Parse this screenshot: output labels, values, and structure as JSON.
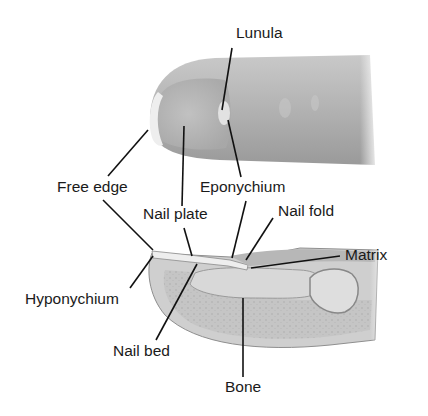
{
  "diagram": {
    "views": [
      "finger-exterior",
      "finger-cross-section"
    ],
    "labels": {
      "lunula": "Lunula",
      "free_edge": "Free edge",
      "eponychium": "Eponychium",
      "nail_plate": "Nail plate",
      "nail_fold": "Nail fold",
      "matrix": "Matrix",
      "hyponychium": "Hyponychium",
      "nail_bed": "Nail bed",
      "bone": "Bone"
    },
    "colors": {
      "background": "#ffffff",
      "skin": "#b5b5b5",
      "skin_dark": "#8e8e8e",
      "nail_highlight": "#ececec",
      "leader_line": "#111111",
      "text": "#1a1a1a"
    }
  }
}
